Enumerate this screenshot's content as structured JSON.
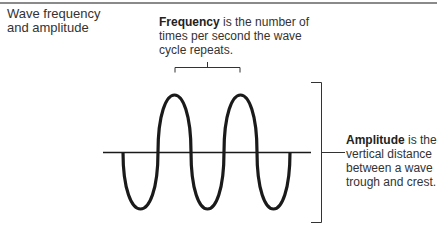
{
  "title": "Wave frequency and amplitude",
  "title_lines": [
    "Wave frequency",
    "and amplitude"
  ],
  "frequency": {
    "term": "Frequency",
    "rest": " is the number of times per second the wave cycle repeats."
  },
  "amplitude": {
    "term": "Amplitude",
    "rest": " is the vertical distance between a wave trough and crest."
  },
  "colors": {
    "rule": "#8a8a8a",
    "wave": "#1a1a1a",
    "text": "#333333"
  }
}
